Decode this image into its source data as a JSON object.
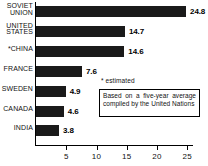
{
  "chart_data": {
    "type": "bar",
    "orientation": "horizontal",
    "title": "",
    "xlabel": "",
    "ylabel": "",
    "categories": [
      "SOVIET UNION",
      "UNITED STATES",
      "*CHINA",
      "FRANCE",
      "SWEDEN",
      "CANADA",
      "INDIA"
    ],
    "values": [
      24.8,
      14.7,
      14.6,
      7.6,
      4.9,
      4.6,
      3.8
    ],
    "value_labels": [
      "24.8",
      "14.7",
      "14.6",
      "7.6",
      "4.9",
      "4.6",
      "3.8"
    ],
    "xticks": [
      5,
      10,
      15,
      20,
      25
    ],
    "xtick_labels": [
      "5",
      "10",
      "15",
      "20",
      "25"
    ],
    "xlim": [
      0,
      26
    ],
    "grid": false,
    "legend": "none",
    "bar_color": "#1a1a1a",
    "annotations": [
      "* estimated",
      "Based on a five-year average compiled by the United Nations"
    ]
  },
  "rows": [
    {
      "label_line1": "SOVIET",
      "label_line2": "UNION",
      "label": "SOVIET\nUNION",
      "value": "24.8",
      "two_line": true
    },
    {
      "label_line1": "UNITED",
      "label_line2": "STATES",
      "label": "UNITED\nSTATES",
      "value": "14.7",
      "two_line": true
    },
    {
      "label_line1": "*CHINA",
      "label_line2": "",
      "label": "*CHINA",
      "value": "14.6",
      "two_line": false
    },
    {
      "label_line1": "FRANCE",
      "label_line2": "",
      "label": "FRANCE",
      "value": "7.6",
      "two_line": false
    },
    {
      "label_line1": "SWEDEN",
      "label_line2": "",
      "label": "SWEDEN",
      "value": "4.9",
      "two_line": false
    },
    {
      "label_line1": "CANADA",
      "label_line2": "",
      "label": "CANADA",
      "value": "4.6",
      "two_line": false
    },
    {
      "label_line1": "INDIA",
      "label_line2": "",
      "label": "INDIA",
      "value": "3.8",
      "two_line": false
    }
  ],
  "axis": {
    "tick_labels": [
      "5",
      "10",
      "15",
      "20",
      "25"
    ]
  },
  "notes": {
    "footnote": "* estimated",
    "box_text": "Based on a five-year average compiled by the United Nations"
  }
}
